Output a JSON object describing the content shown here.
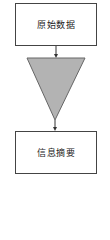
{
  "diagram": {
    "nodes": [
      {
        "id": "source",
        "label": "原始数据",
        "shape": "rectangle"
      },
      {
        "id": "funnel",
        "label": "",
        "shape": "inverted-triangle",
        "fill": "#b3b3b3"
      },
      {
        "id": "summary",
        "label": "信息摘要",
        "shape": "rectangle"
      }
    ],
    "edges": [
      {
        "from": "source",
        "to": "funnel"
      },
      {
        "from": "funnel",
        "to": "summary"
      }
    ]
  },
  "colors": {
    "stroke": "#444444",
    "triangle_fill": "#b3b3b3",
    "background": "#ffffff"
  }
}
